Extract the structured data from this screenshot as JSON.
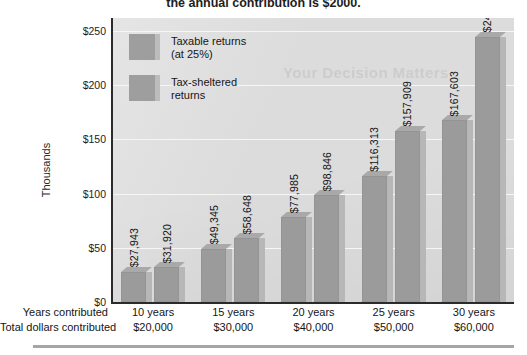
{
  "caption": {
    "text": "the annual contribution is $2000."
  },
  "page_bleed_text": "Your Decision Matters",
  "chart_data": {
    "type": "bar",
    "title": "",
    "subtitle": "",
    "xlabel": "",
    "ylabel": "Thousands",
    "ylim": [
      0,
      262
    ],
    "grid": true,
    "legend_position": "inside-top-left",
    "categories": [
      "10 years",
      "15 years",
      "20 years",
      "25 years",
      "30 years"
    ],
    "category_sublabels": [
      "$20,000",
      "$30,000",
      "$40,000",
      "$50,000",
      "$60,000"
    ],
    "y_ticks": [
      "$0",
      "$50",
      "$100",
      "$150",
      "$200",
      "$250"
    ],
    "y_tick_values": [
      0,
      50,
      100,
      150,
      200,
      250
    ],
    "series": [
      {
        "name": "Taxable returns (at 25%)",
        "values": [
          27943,
          49345,
          77985,
          116313,
          167603
        ],
        "labels": [
          "$27,943",
          "$49,345",
          "$77,985",
          "$116,313",
          "$167,603"
        ],
        "color": "#9b9b9b"
      },
      {
        "name": "Tax-sheltered returns",
        "values": [
          31920,
          58648,
          98846,
          157909,
          244691
        ],
        "labels": [
          "$31,920",
          "$58,648",
          "$98,846",
          "$157,909",
          "$244,691"
        ],
        "color": "#9b9b9b"
      }
    ]
  },
  "legend": {
    "items": [
      {
        "line1": "Taxable returns",
        "line2": "(at 25%)"
      },
      {
        "line1": "Tax-sheltered",
        "line2": "returns"
      }
    ]
  },
  "axis_table": {
    "rows": [
      {
        "label": "Years contributed",
        "cells": [
          "10 years",
          "15 years",
          "20 years",
          "25 years",
          "30 years"
        ]
      },
      {
        "label": "Total dollars contributed",
        "cells": [
          "$20,000",
          "$30,000",
          "$40,000",
          "$50,000",
          "$60,000"
        ]
      }
    ]
  },
  "colors": {
    "bar_face": "#9b9b9b",
    "bar_side": "#b7b7b7",
    "plot_background": "#dcdcdc",
    "gridline": "#f6f6f6",
    "axis": "#2b2b2b"
  }
}
